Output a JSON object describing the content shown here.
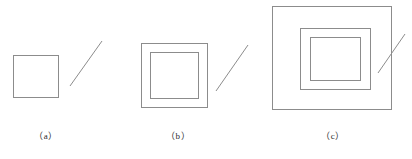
{
  "figure": {
    "width": 412,
    "height": 159,
    "background_color": "#ffffff",
    "stroke_color": "#8c8c8c",
    "caption_color": "#2b2b2b",
    "panels": [
      {
        "id": "a",
        "caption": "（a）",
        "caption_x": 18,
        "caption_y": 129,
        "caption_width": 56,
        "rect_count": 1,
        "rects": [
          {
            "name": "outer-rectangle",
            "x": 13,
            "y": 55,
            "w": 46,
            "h": 43
          }
        ],
        "diagonal": {
          "name": "diagonal-line",
          "x1": 70,
          "y1": 86,
          "x2": 102,
          "y2": 41
        }
      },
      {
        "id": "b",
        "caption": "（b）",
        "caption_x": 150,
        "caption_y": 129,
        "caption_width": 56,
        "rect_count": 2,
        "rects": [
          {
            "name": "outer-rectangle",
            "x": 141,
            "y": 43,
            "w": 67,
            "h": 65
          },
          {
            "name": "inner-rectangle",
            "x": 150,
            "y": 52,
            "w": 49,
            "h": 47
          }
        ],
        "diagonal": {
          "name": "diagonal-line",
          "x1": 216,
          "y1": 91,
          "x2": 248,
          "y2": 45
        }
      },
      {
        "id": "c",
        "caption": "（c）",
        "caption_x": 305,
        "caption_y": 129,
        "caption_width": 56,
        "rect_count": 3,
        "rects": [
          {
            "name": "outer-rectangle",
            "x": 272,
            "y": 6,
            "w": 120,
            "h": 104
          },
          {
            "name": "middle-rectangle",
            "x": 300,
            "y": 28,
            "w": 71,
            "h": 62
          },
          {
            "name": "inner-rectangle",
            "x": 310,
            "y": 37,
            "w": 51,
            "h": 44
          }
        ],
        "diagonal": {
          "name": "diagonal-line",
          "x1": 378,
          "y1": 73,
          "x2": 405,
          "y2": 34
        }
      }
    ]
  }
}
